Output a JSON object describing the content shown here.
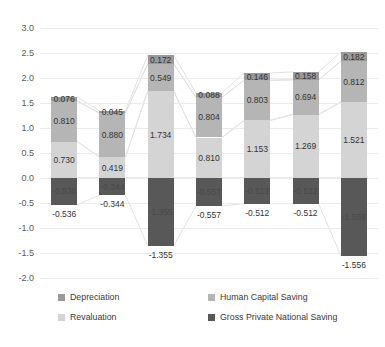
{
  "chart_data": {
    "type": "bar",
    "subtype": "stacked-bar-with-connectors",
    "title": "",
    "xlabel": "",
    "ylabel": "",
    "ylim": [
      -2.0,
      3.0
    ],
    "ytick_step": 0.5,
    "ytick_labels": [
      "3.0",
      "2.5",
      "2.0",
      "1.5",
      "1.0",
      "0.5",
      "0.0",
      "-0.5",
      "-1.0",
      "-1.5",
      "-2.0"
    ],
    "grid": true,
    "legend_position": "bottom",
    "categories": [
      "1",
      "2",
      "3",
      "4",
      "5",
      "6",
      "7"
    ],
    "series": [
      {
        "name": "Depreciation",
        "color": "#9a9a9a",
        "values": [
          0.076,
          0.045,
          0.172,
          0.088,
          0.146,
          0.158,
          0.182
        ],
        "labels": [
          "0.076",
          "0.045",
          "0.172",
          "0.088",
          "0.146",
          "0.158",
          "0.182"
        ]
      },
      {
        "name": "Human Capital Saving",
        "color": "#b5b5b5",
        "values": [
          0.81,
          0.88,
          0.549,
          0.804,
          0.803,
          0.694,
          0.812
        ],
        "labels": [
          "0.810",
          "0.880",
          "0.549",
          "0.804",
          "0.803",
          "0.694",
          "0.812"
        ]
      },
      {
        "name": "Revaluation",
        "color": "#d4d4d4",
        "values": [
          0.73,
          0.419,
          1.734,
          0.81,
          1.153,
          1.269,
          1.521
        ],
        "labels": [
          "0.730",
          "0.419",
          "1.734",
          "0.810",
          "1.153",
          "1.269",
          "1.521"
        ]
      },
      {
        "name": "Gross Private National Saving",
        "color": "#585858",
        "values": [
          -0.536,
          -0.344,
          -1.355,
          -0.557,
          -0.512,
          -0.512,
          -1.556
        ],
        "labels": [
          "-0.536",
          "-0.344",
          "-1.355",
          "-0.557",
          "-0.512",
          "-0.512",
          "-1.556"
        ]
      }
    ],
    "outside_labels": [
      {
        "bar": 0,
        "value": -0.536,
        "text": "-0.536"
      },
      {
        "bar": 1,
        "value": -0.344,
        "text": "-0.344"
      },
      {
        "bar": 2,
        "value": -1.355,
        "text": "-1.355"
      },
      {
        "bar": 3,
        "value": -0.557,
        "text": "-0.557"
      },
      {
        "bar": 4,
        "value": -0.512,
        "text": "-0.512"
      },
      {
        "bar": 5,
        "value": -0.512,
        "text": "-0.512"
      },
      {
        "bar": 6,
        "value": -1.556,
        "text": "-1.556"
      }
    ]
  },
  "legend": {
    "items": [
      {
        "label": "Depreciation",
        "color": "#9a9a9a"
      },
      {
        "label": "Human Capital Saving",
        "color": "#b5b5b5"
      },
      {
        "label": "Revaluation",
        "color": "#d4d4d4"
      },
      {
        "label": "Gross Private National Saving",
        "color": "#585858"
      }
    ]
  },
  "colors": {
    "gridline": "#eceaea",
    "connector": "#e2e2e2",
    "text": "#3a3a3a",
    "background": "#ffffff"
  }
}
